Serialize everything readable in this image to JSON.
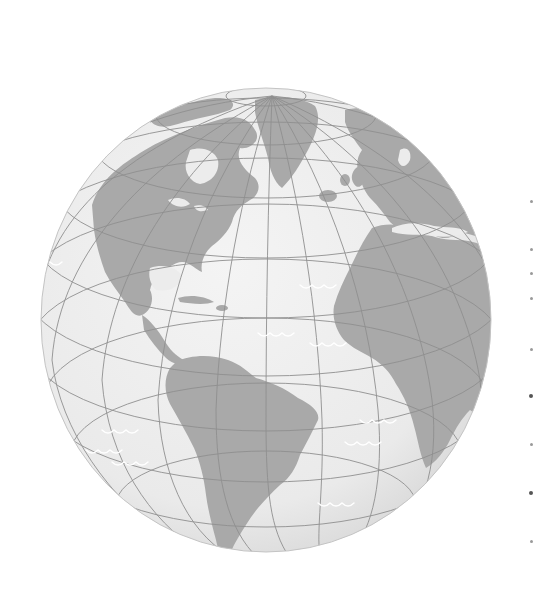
{
  "scene": {
    "subject": "globe-illustration",
    "view": "Atlantic hemisphere (Americas, Europe, Africa)",
    "colors": {
      "background": "#ffffff",
      "ocean": "#ededed",
      "ocean_shade": "#d9d9d9",
      "land": "#a9a9a9",
      "grid": "#8e8e8e",
      "wave": "#ffffff"
    },
    "globe": {
      "cx": 266,
      "cy": 320,
      "rx": 225,
      "ry": 232
    },
    "edge_ticks": [
      {
        "y": 200,
        "dark": false
      },
      {
        "y": 248,
        "dark": false
      },
      {
        "y": 272,
        "dark": false
      },
      {
        "y": 297,
        "dark": false
      },
      {
        "y": 348,
        "dark": false
      },
      {
        "y": 394,
        "dark": true
      },
      {
        "y": 443,
        "dark": false
      },
      {
        "y": 491,
        "dark": true
      },
      {
        "y": 540,
        "dark": false
      }
    ]
  }
}
